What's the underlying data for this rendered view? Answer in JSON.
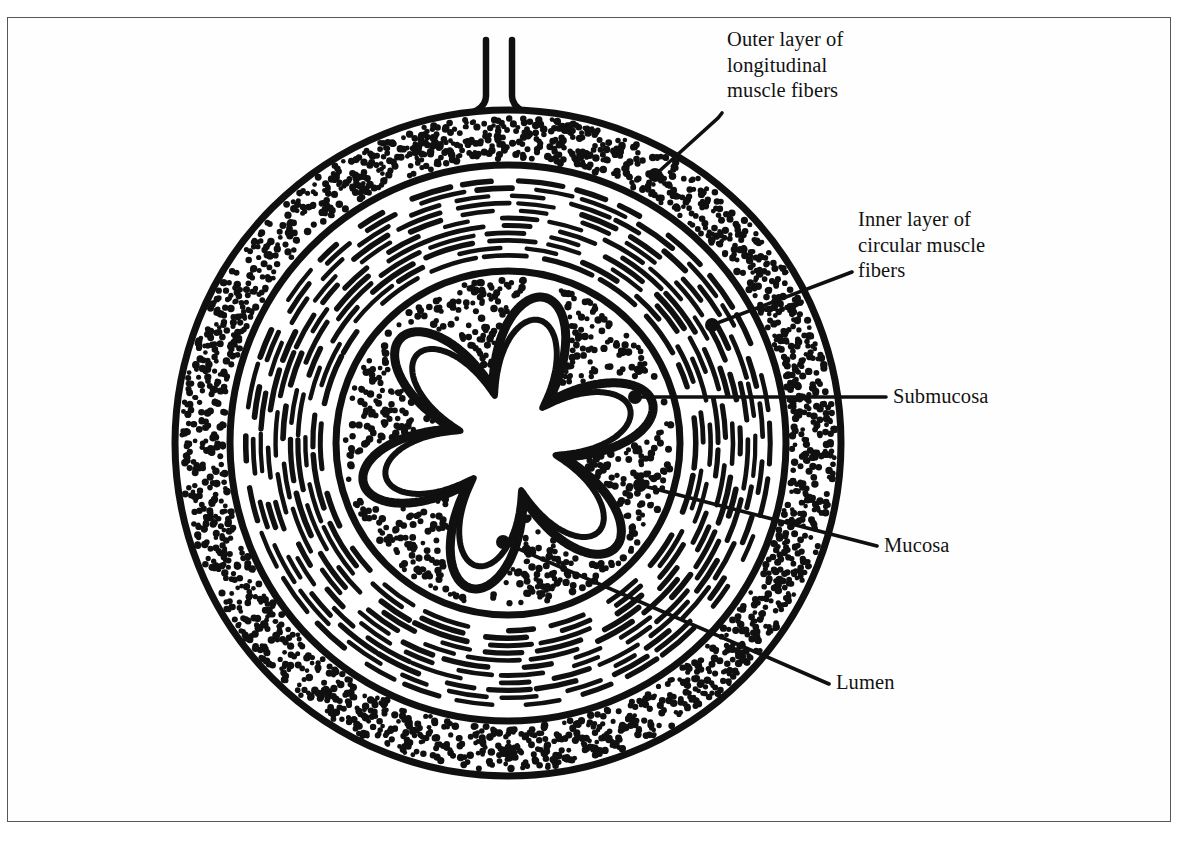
{
  "figure": {
    "kind": "anatomical-cross-section",
    "frame": {
      "stroke": "#55585c",
      "background": "#ffffff"
    },
    "ink_color": "#101010",
    "center": {
      "x": 508,
      "y": 443
    },
    "layers": [
      {
        "id": "outer-longitudinal",
        "name": "Outer layer of longitudinal muscle fibers",
        "texture": "stipple",
        "outer_radius": 333,
        "inner_radius": 278
      },
      {
        "id": "inner-circular",
        "name": "Inner layer of circular muscle fibers",
        "texture": "concentric-dashes",
        "outer_radius": 278,
        "inner_radius": 172
      },
      {
        "id": "submucosa",
        "name": "Submucosa",
        "texture": "stipple",
        "outer_radius": 172,
        "inner_radius": 0
      },
      {
        "id": "mucosa",
        "name": "Mucosa",
        "texture": "double-outline",
        "shape": "star-lobed",
        "lobes": 6
      },
      {
        "id": "lumen",
        "name": "Lumen",
        "texture": "blank",
        "shape": "star"
      }
    ],
    "mesentery": {
      "name": "Mesentery stalk",
      "top_y": 40,
      "base_y": 118
    }
  },
  "labels": [
    {
      "id": "outer-longitudinal",
      "text": "Outer layer of\nlongitudinal\nmuscle fibers",
      "anchor": {
        "x": 655,
        "y": 175
      },
      "elbow": {
        "x": 718,
        "y": 118
      },
      "end": {
        "x": 722,
        "y": 113
      }
    },
    {
      "id": "inner-circular",
      "text": "Inner layer of\ncircular muscle\nfibers",
      "anchor": {
        "x": 712,
        "y": 325
      },
      "end": {
        "x": 852,
        "y": 272
      }
    },
    {
      "id": "submucosa",
      "text": "Submucosa",
      "anchor": {
        "x": 635,
        "y": 397
      },
      "end": {
        "x": 886,
        "y": 397
      }
    },
    {
      "id": "mucosa",
      "text": "Mucosa",
      "anchor": {
        "x": 640,
        "y": 485
      },
      "end": {
        "x": 877,
        "y": 546
      }
    },
    {
      "id": "lumen",
      "text": "Lumen",
      "anchor": {
        "x": 503,
        "y": 542
      },
      "end": {
        "x": 829,
        "y": 684
      }
    }
  ],
  "label_lines": {
    "outer_longitudinal": "Outer layer of\nlongitudinal\nmuscle fibers",
    "inner_circular": "Inner layer of\ncircular muscle\nfibers",
    "submucosa": "Submucosa",
    "mucosa": "Mucosa",
    "lumen": "Lumen"
  }
}
